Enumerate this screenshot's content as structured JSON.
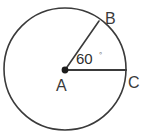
{
  "figure": {
    "type": "circle-with-central-angle",
    "background_color": "#ffffff",
    "stroke_color": "#3a3a3a",
    "circle": {
      "center_x": 65,
      "center_y": 69,
      "radius": 61,
      "stroke_width": 1.6
    },
    "center_point": {
      "name": "A",
      "x": 65,
      "y": 70,
      "dot_radius": 3.4,
      "fill": "#1c1c1c"
    },
    "radii": [
      {
        "name": "radius-A-to-B",
        "from": "A",
        "to": "B",
        "x1": 65,
        "y1": 70,
        "x2": 99,
        "y2": 21,
        "stroke_width": 1.6
      },
      {
        "name": "radius-A-to-C",
        "from": "A",
        "to": "C",
        "x1": 65,
        "y1": 70,
        "x2": 126,
        "y2": 70,
        "stroke_width": 2.2
      }
    ],
    "labels": {
      "a": "A",
      "b": "B",
      "c": "C"
    },
    "label_positions": {
      "a": {
        "x": 56,
        "y": 91
      },
      "b": {
        "x": 105,
        "y": 24
      },
      "c": {
        "x": 128,
        "y": 88
      }
    },
    "angle": {
      "value": "60",
      "degree_symbol": "◦",
      "unit_label": "degrees",
      "at_vertex": "A",
      "between": [
        "B",
        "C"
      ],
      "text_x": 76,
      "text_y": 64,
      "symbol_x": 99,
      "symbol_y": 56
    }
  }
}
